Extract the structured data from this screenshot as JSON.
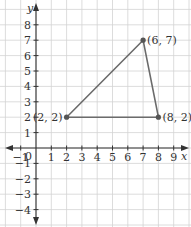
{
  "chart_data": {
    "type": "scatter",
    "title": "",
    "xlabel": "x",
    "ylabel": "y",
    "xlim": [
      -1,
      9
    ],
    "ylim": [
      -4,
      8
    ],
    "grid": true,
    "x_ticks": [
      "-1",
      "1",
      "2",
      "3",
      "4",
      "5",
      "6",
      "7",
      "8",
      "9"
    ],
    "y_ticks": [
      "8",
      "7",
      "6",
      "5",
      "4",
      "3",
      "2",
      "1",
      "-1",
      "-2",
      "-3",
      "-4"
    ],
    "origin_label": "0",
    "shape": "triangle",
    "series": [
      {
        "name": "triangle",
        "points": [
          {
            "label": "(2, 2)",
            "x": 2,
            "y": 2
          },
          {
            "label": "(6, 7)",
            "x": 7,
            "y": 7
          },
          {
            "label": "(8, 2)",
            "x": 8,
            "y": 2
          }
        ]
      }
    ]
  },
  "colors": {
    "grid": "#d3d3d3",
    "axis": "#333333",
    "triangle": "#6b6b6b",
    "point": "#555555"
  }
}
